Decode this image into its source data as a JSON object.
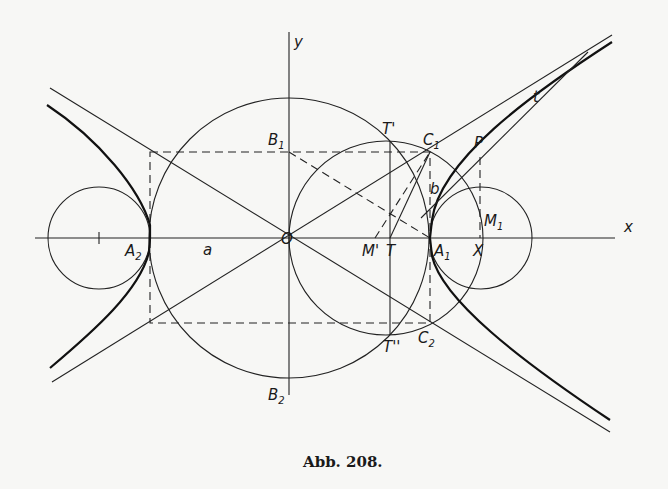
{
  "figure": {
    "caption": "Abb. 208.",
    "colors": {
      "ink": "#1a1a1a",
      "paper": "#f7f7f5"
    },
    "axes": {
      "x_label": "x",
      "y_label": "y",
      "origin_label": "O"
    },
    "labels": {
      "a": "a",
      "b": "b",
      "t": "t",
      "P": "P",
      "X": "X",
      "T": "T",
      "T1": "T'",
      "T2": "T''",
      "M_prime": "M'",
      "A1": {
        "main": "A",
        "sub": "1"
      },
      "A2": {
        "main": "A",
        "sub": "2"
      },
      "B1": {
        "main": "B",
        "sub": "1"
      },
      "B2": {
        "main": "B",
        "sub": "2"
      },
      "C1": {
        "main": "C",
        "sub": "1"
      },
      "C2": {
        "main": "C",
        "sub": "2"
      },
      "M1": {
        "main": "M",
        "sub": "1"
      }
    },
    "elements": [
      "hyperbola (both branches)",
      "asymptotes",
      "tangent t at P",
      "circle radius a centered at O (through B1, B2)",
      "circle through O, T', C1, C2, T''",
      "osculating circles at vertices A1, A2 (center M1)",
      "dashed rectangle 2a x 2b"
    ]
  }
}
